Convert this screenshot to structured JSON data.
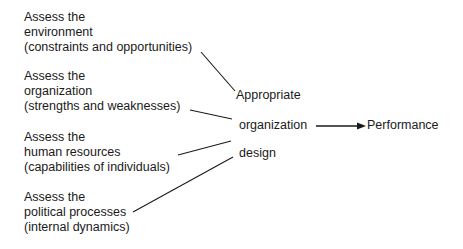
{
  "inputs": [
    {
      "lines": [
        "Assess the",
        "environment",
        "(constraints and opportunities)"
      ]
    },
    {
      "lines": [
        "Assess the",
        "organization",
        "(strengths and weaknesses)"
      ]
    },
    {
      "lines": [
        "Assess the",
        "human resources",
        "(capabilities of individuals)"
      ]
    },
    {
      "lines": [
        "Assess the",
        "political processes",
        "(internal dynamics)"
      ]
    }
  ],
  "center": {
    "line1": "Appropriate",
    "line2": "organization",
    "line3": "design"
  },
  "output": {
    "label": "Performance"
  },
  "colors": {
    "line": "#1a1a1a",
    "text": "#1a1a1a"
  }
}
